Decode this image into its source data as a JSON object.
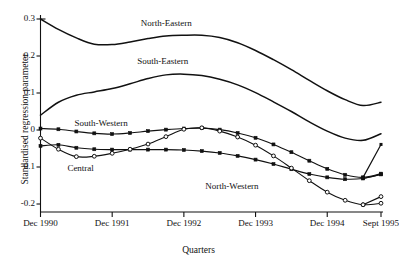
{
  "figure": {
    "caption_sliver": "",
    "background": "#ffffff",
    "ink": "#111111"
  },
  "chart_data": {
    "type": "line",
    "title": "",
    "xlabel": "Quarters",
    "ylabel": "Standardised regression parameter",
    "ylim": [
      -0.25,
      0.305
    ],
    "xlim": [
      0,
      19
    ],
    "grid": false,
    "legend": "inline-labels",
    "yticks": [
      "0.3",
      "0.2",
      "0.1",
      "0",
      "-0.1",
      "-0.2"
    ],
    "ytick_values": [
      0.3,
      0.2,
      0.1,
      0,
      -0.1,
      -0.2
    ],
    "xtick_labels": [
      "Dec 1990",
      "Dec 1991",
      "Dec 1992",
      "Dec 1993",
      "Dec 1994",
      "Sept 1995"
    ],
    "xtick_values": [
      0,
      4,
      8,
      12,
      16,
      19
    ],
    "x": [
      0,
      1,
      2,
      3,
      4,
      5,
      6,
      7,
      8,
      9,
      10,
      11,
      12,
      13,
      14,
      15,
      16,
      17,
      18,
      19
    ],
    "series": [
      {
        "name": "North-Eastern",
        "marker": "none",
        "label_x": 5.6,
        "label_y": 0.289,
        "values": [
          0.3,
          0.272,
          0.249,
          0.232,
          0.231,
          0.238,
          0.247,
          0.254,
          0.256,
          0.256,
          0.25,
          0.236,
          0.215,
          0.19,
          0.163,
          0.134,
          0.106,
          0.082,
          0.066,
          0.075
        ]
      },
      {
        "name": "South-Eastern",
        "marker": "none",
        "label_x": 5.4,
        "label_y": 0.186,
        "values": [
          0.04,
          0.075,
          0.094,
          0.103,
          0.112,
          0.125,
          0.139,
          0.149,
          0.151,
          0.147,
          0.137,
          0.122,
          0.101,
          0.076,
          0.05,
          0.022,
          -0.003,
          -0.022,
          -0.028,
          -0.01
        ]
      },
      {
        "name": "South-Western",
        "marker": "filled-square",
        "label_x": 1.9,
        "label_y": 0.018,
        "values": [
          0.004,
          0.002,
          -0.004,
          -0.009,
          -0.011,
          -0.008,
          -0.003,
          0.001,
          0.004,
          0.005,
          0.001,
          -0.008,
          -0.021,
          -0.039,
          -0.06,
          -0.083,
          -0.105,
          -0.121,
          -0.128,
          -0.118
        ]
      },
      {
        "name": "Central",
        "marker": "filled-square",
        "label_x": 1.5,
        "label_y": -0.104,
        "values": [
          -0.043,
          -0.04,
          -0.048,
          -0.052,
          -0.053,
          -0.053,
          -0.053,
          -0.053,
          -0.054,
          -0.057,
          -0.062,
          -0.07,
          -0.08,
          -0.092,
          -0.106,
          -0.119,
          -0.128,
          -0.133,
          -0.131,
          -0.12
        ]
      },
      {
        "name": "North-Western",
        "marker": "open-circle",
        "label_x": 9.2,
        "label_y": -0.152,
        "values": [
          -0.022,
          -0.052,
          -0.072,
          -0.071,
          -0.063,
          -0.052,
          -0.038,
          -0.018,
          0.002,
          0.006,
          -0.003,
          -0.019,
          -0.041,
          -0.07,
          -0.103,
          -0.137,
          -0.168,
          -0.19,
          -0.202,
          -0.198
        ]
      }
    ],
    "extra_marked_paths": [
      {
        "name": "south-western-tail",
        "marker": "filled-square",
        "note": "sharp terminal upswing of South-Western at final quarter",
        "x": [
          18,
          19
        ],
        "values": [
          -0.128,
          -0.039
        ]
      },
      {
        "name": "central-tail",
        "marker": "filled-square",
        "note": "terminal upswing of Central at final quarter",
        "x": [
          18,
          19
        ],
        "values": [
          -0.131,
          -0.12
        ]
      },
      {
        "name": "north-western-tail",
        "marker": "open-circle",
        "note": "terminal upswing of North-Western at final quarter",
        "x": [
          18,
          19
        ],
        "values": [
          -0.202,
          -0.18
        ]
      }
    ]
  }
}
